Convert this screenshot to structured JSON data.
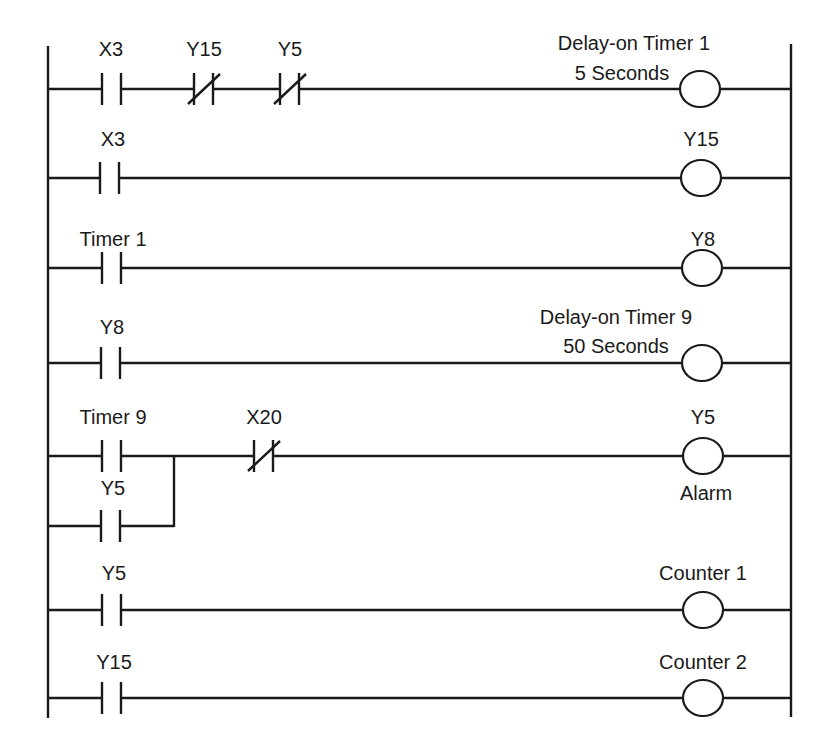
{
  "diagram": {
    "type": "ladder-logic",
    "rails": {
      "left_x": 48,
      "right_x": 791,
      "top_y": 44,
      "bottom_y": 718
    },
    "rungs": [
      {
        "y": 89,
        "contacts": [
          {
            "label": "X3",
            "type": "NO",
            "x": 110
          },
          {
            "label": "Y15",
            "type": "NC",
            "x": 202
          },
          {
            "label": "Y5",
            "type": "NC",
            "x": 288
          }
        ],
        "coil": {
          "label_line1": "Delay-on Timer 1",
          "label_line2": "5 Seconds",
          "x": 700
        }
      },
      {
        "y": 178,
        "contacts": [
          {
            "label": "X3",
            "type": "NO",
            "x": 110
          }
        ],
        "coil": {
          "label_line1": "Y15",
          "x": 700
        }
      },
      {
        "y": 268,
        "contacts": [
          {
            "label": "Timer 1",
            "type": "NO",
            "x": 110
          }
        ],
        "coil": {
          "label_line1": "Y8",
          "x": 700
        }
      },
      {
        "y": 363,
        "contacts": [
          {
            "label": "Y8",
            "type": "NO",
            "x": 110
          }
        ],
        "coil": {
          "label_line1": "Delay-on Timer 9",
          "label_line2": "50 Seconds",
          "x": 700
        }
      },
      {
        "y": 456,
        "contacts": [
          {
            "label": "Timer 9",
            "type": "NO",
            "x": 110
          },
          {
            "label": "X20",
            "type": "NC",
            "x": 262
          }
        ],
        "branch": {
          "y": 526,
          "contact": {
            "label": "Y5",
            "type": "NO",
            "x": 110
          },
          "join_x": 174
        },
        "coil": {
          "label_line1": "Y5",
          "label_below": "Alarm",
          "x": 702
        }
      },
      {
        "y": 610,
        "contacts": [
          {
            "label": "Y5",
            "type": "NO",
            "x": 110
          }
        ],
        "coil": {
          "label_line1": "Counter 1",
          "x": 702
        }
      },
      {
        "y": 698,
        "contacts": [
          {
            "label": "Y15",
            "type": "NO",
            "x": 110
          }
        ],
        "coil": {
          "label_line1": "Counter 2",
          "x": 702
        }
      }
    ],
    "colors": {
      "line": "#1a1a1a",
      "background": "#ffffff"
    }
  }
}
